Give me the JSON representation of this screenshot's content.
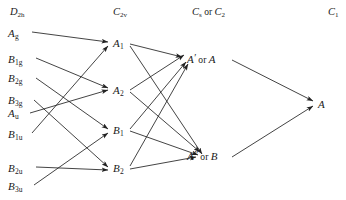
{
  "diagram": {
    "type": "correlation-diagram",
    "width": 346,
    "height": 200,
    "background_color": "#ffffff",
    "line_color": "#222222",
    "text_color": "#1a1a1a"
  },
  "headers": [
    {
      "id": "h-d2h",
      "text": "D2h",
      "main": "D",
      "sub": "2h",
      "x": 10,
      "y": 12
    },
    {
      "id": "h-c2v",
      "text": "C2v",
      "main": "C",
      "sub": "2v",
      "x": 113,
      "y": 12
    },
    {
      "id": "h-cs",
      "text": "Cs or C2",
      "main": "C",
      "sub": "s",
      "joiner": " or ",
      "main2": "C",
      "sub2": "2",
      "x": 192,
      "y": 12
    },
    {
      "id": "h-c1",
      "text": "C1",
      "main": "C",
      "sub": "1",
      "x": 328,
      "y": 12
    }
  ],
  "columns": {
    "d2h": {
      "name": "D2h",
      "nodes": [
        {
          "id": "Ag",
          "main": "A",
          "sub": "g",
          "x": 8,
          "y": 33
        },
        {
          "id": "B1g",
          "main": "B",
          "sub": "1g",
          "x": 8,
          "y": 59
        },
        {
          "id": "B2g",
          "main": "B",
          "sub": "2g",
          "x": 8,
          "y": 78
        },
        {
          "id": "B3g",
          "main": "B",
          "sub": "3g",
          "x": 8,
          "y": 100
        },
        {
          "id": "Au",
          "main": "A",
          "sub": "u",
          "x": 8,
          "y": 113
        },
        {
          "id": "B1u",
          "main": "B",
          "sub": "1u",
          "x": 8,
          "y": 134
        },
        {
          "id": "B2u",
          "main": "B",
          "sub": "2u",
          "x": 8,
          "y": 168
        },
        {
          "id": "B3u",
          "main": "B",
          "sub": "3u",
          "x": 8,
          "y": 186
        }
      ]
    },
    "c2v": {
      "name": "C2v",
      "nodes": [
        {
          "id": "A1",
          "main": "A",
          "sub": "1",
          "x": 113,
          "y": 43
        },
        {
          "id": "A2",
          "main": "A",
          "sub": "2",
          "x": 113,
          "y": 90
        },
        {
          "id": "B1",
          "main": "B",
          "sub": "1",
          "x": 113,
          "y": 130
        },
        {
          "id": "B2",
          "main": "B",
          "sub": "2",
          "x": 113,
          "y": 168
        }
      ]
    },
    "cs_c2": {
      "name": "Cs or C2",
      "nodes": [
        {
          "id": "Ap",
          "main": "A",
          "prime": "′",
          "joiner": "or",
          "alt": "A",
          "x": 187,
          "y": 60
        },
        {
          "id": "App",
          "main": "A",
          "prime": "″",
          "joiner": "or",
          "alt": "B",
          "x": 187,
          "y": 157
        }
      ]
    },
    "c1": {
      "name": "C1",
      "nodes": [
        {
          "id": "A",
          "main": "A",
          "sub": "",
          "x": 318,
          "y": 104
        }
      ]
    }
  },
  "edges": [
    {
      "from": "Ag",
      "to": "A1",
      "x1": 32,
      "y1": 32,
      "x2": 108,
      "y2": 42
    },
    {
      "from": "B1g",
      "to": "A2",
      "x1": 36,
      "y1": 58,
      "x2": 108,
      "y2": 88
    },
    {
      "from": "B2g",
      "to": "B1",
      "x1": 36,
      "y1": 78,
      "x2": 108,
      "y2": 129
    },
    {
      "from": "B3g",
      "to": "B2",
      "x1": 34,
      "y1": 100,
      "x2": 108,
      "y2": 167
    },
    {
      "from": "Au",
      "to": "A2",
      "x1": 30,
      "y1": 113,
      "x2": 108,
      "y2": 90
    },
    {
      "from": "B1u",
      "to": "A1",
      "x1": 32,
      "y1": 133,
      "x2": 108,
      "y2": 46
    },
    {
      "from": "B2u",
      "to": "B2",
      "x1": 36,
      "y1": 167,
      "x2": 108,
      "y2": 170
    },
    {
      "from": "B3u",
      "to": "B1",
      "x1": 34,
      "y1": 185,
      "x2": 108,
      "y2": 133
    },
    {
      "from": "A1",
      "to": "Ap",
      "x1": 130,
      "y1": 44,
      "x2": 182,
      "y2": 57
    },
    {
      "from": "A1",
      "to": "App",
      "x1": 130,
      "y1": 46,
      "x2": 202,
      "y2": 154
    },
    {
      "from": "A2",
      "to": "Ap",
      "x1": 130,
      "y1": 90,
      "x2": 184,
      "y2": 55
    },
    {
      "from": "A2",
      "to": "App",
      "x1": 130,
      "y1": 92,
      "x2": 200,
      "y2": 152
    },
    {
      "from": "B1",
      "to": "Ap",
      "x1": 130,
      "y1": 129,
      "x2": 186,
      "y2": 62
    },
    {
      "from": "B1",
      "to": "App",
      "x1": 130,
      "y1": 131,
      "x2": 198,
      "y2": 155
    },
    {
      "from": "B2",
      "to": "Ap",
      "x1": 130,
      "y1": 166,
      "x2": 188,
      "y2": 64
    },
    {
      "from": "B2",
      "to": "App",
      "x1": 130,
      "y1": 169,
      "x2": 196,
      "y2": 157
    },
    {
      "from": "Ap",
      "to": "A",
      "x1": 232,
      "y1": 60,
      "x2": 313,
      "y2": 101
    },
    {
      "from": "App",
      "to": "A",
      "x1": 232,
      "y1": 157,
      "x2": 313,
      "y2": 106
    }
  ]
}
